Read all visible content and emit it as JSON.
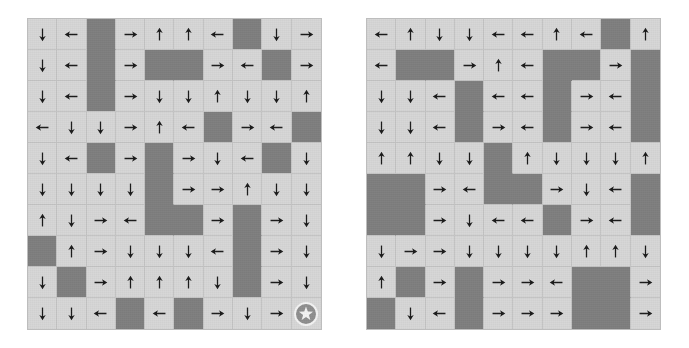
{
  "figure": {
    "type": "gridworld-policy-pair",
    "rows": 10,
    "cols": 10,
    "cell_colors": {
      "free": "#d6d6d6",
      "obstacle": "#7e7e7e",
      "gridline": "#c3c3c3",
      "panel_border": "#bdbdbd",
      "arrow": "#1a1a1a",
      "goal_fill": "#8e8e8e",
      "goal_star": "#f2f2f2"
    },
    "legend": {
      "arrow_up": "up-arrow-icon",
      "arrow_down": "down-arrow-icon",
      "arrow_left": "left-arrow-icon",
      "arrow_right": "right-arrow-icon",
      "obstacle": "obstacle-cell",
      "goal": "goal-star-icon"
    }
  },
  "panels": [
    {
      "id": "left",
      "name": "left-gridworld",
      "goal": {
        "row": 9,
        "col": 9,
        "icon": "goal-star-icon"
      },
      "cells": [
        [
          "down",
          "left",
          "block",
          "right",
          "up",
          "up",
          "left",
          "block",
          "down",
          "right"
        ],
        [
          "down",
          "left",
          "block",
          "right",
          "block",
          "block",
          "right",
          "left",
          "block",
          "right"
        ],
        [
          "down",
          "left",
          "block",
          "right",
          "down",
          "down",
          "up",
          "down",
          "down",
          "up"
        ],
        [
          "left",
          "down",
          "down",
          "right",
          "up",
          "left",
          "block",
          "right",
          "left",
          "block"
        ],
        [
          "down",
          "left",
          "block",
          "right",
          "block",
          "right",
          "down",
          "left",
          "block",
          "down"
        ],
        [
          "down",
          "down",
          "down",
          "down",
          "block",
          "right",
          "right",
          "up",
          "down",
          "down"
        ],
        [
          "up",
          "down",
          "right",
          "left",
          "block",
          "block",
          "right",
          "block",
          "right",
          "down"
        ],
        [
          "block",
          "up",
          "right",
          "down",
          "down",
          "down",
          "left",
          "block",
          "right",
          "down"
        ],
        [
          "down",
          "block",
          "right",
          "up",
          "up",
          "up",
          "down",
          "block",
          "right",
          "down"
        ],
        [
          "down",
          "down",
          "left",
          "block",
          "left",
          "block",
          "right",
          "down",
          "right",
          "goal"
        ]
      ]
    },
    {
      "id": "right",
      "name": "right-gridworld",
      "goal": {
        "row": 9,
        "col": 9,
        "icon": "goal-star-icon"
      },
      "cells": [
        [
          "left",
          "up",
          "down",
          "down",
          "left",
          "left",
          "up",
          "left",
          "block",
          "up"
        ],
        [
          "left",
          "block",
          "block",
          "right",
          "up",
          "left",
          "block",
          "block",
          "right",
          "block"
        ],
        [
          "down",
          "down",
          "left",
          "block",
          "left",
          "left",
          "block",
          "right",
          "left",
          "block"
        ],
        [
          "down",
          "down",
          "left",
          "block",
          "right",
          "left",
          "block",
          "right",
          "left",
          "block"
        ],
        [
          "up",
          "up",
          "down",
          "down",
          "block",
          "up",
          "down",
          "down",
          "down",
          "up"
        ],
        [
          "block",
          "block",
          "right",
          "left",
          "block",
          "block",
          "right",
          "down",
          "left",
          "block"
        ],
        [
          "block",
          "block",
          "right",
          "down",
          "left",
          "left",
          "block",
          "right",
          "left",
          "block"
        ],
        [
          "down",
          "right",
          "right",
          "down",
          "down",
          "down",
          "down",
          "up",
          "up",
          "down"
        ],
        [
          "up",
          "block",
          "right",
          "block",
          "right",
          "right",
          "left",
          "block",
          "block",
          "right"
        ],
        [
          "block",
          "down",
          "left",
          "block",
          "right",
          "right",
          "right",
          "block",
          "block",
          "right"
        ]
      ]
    }
  ]
}
